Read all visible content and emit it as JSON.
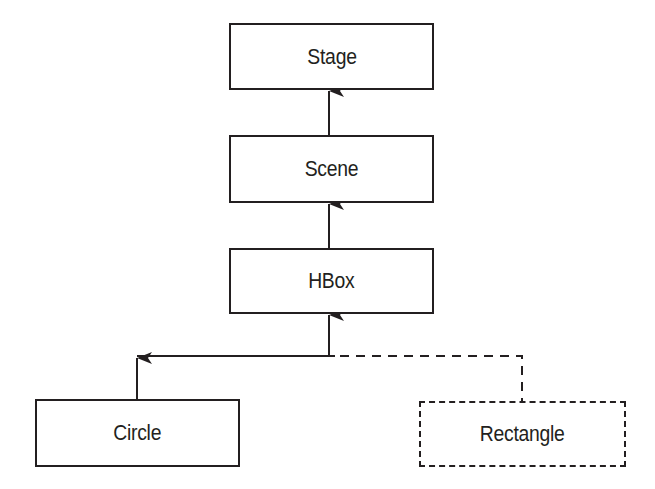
{
  "diagram": {
    "type": "scene-graph hierarchy",
    "colors": {
      "line": "#231f20",
      "background": "#ffffff"
    },
    "nodes": [
      {
        "id": "stage",
        "label": "Stage",
        "style": "solid"
      },
      {
        "id": "scene",
        "label": "Scene",
        "style": "solid"
      },
      {
        "id": "hbox",
        "label": "HBox",
        "style": "solid"
      },
      {
        "id": "circle",
        "label": "Circle",
        "style": "solid"
      },
      {
        "id": "rectangle",
        "label": "Rectangle",
        "style": "dashed"
      }
    ],
    "edges": [
      {
        "from": "scene",
        "to": "stage",
        "style": "solid",
        "arrow": "to"
      },
      {
        "from": "hbox",
        "to": "scene",
        "style": "solid",
        "arrow": "to"
      },
      {
        "from": "circle",
        "to": "hbox",
        "style": "solid",
        "arrow": "to"
      },
      {
        "from": "rectangle",
        "to": "hbox",
        "style": "dashed",
        "arrow": "to"
      }
    ]
  }
}
